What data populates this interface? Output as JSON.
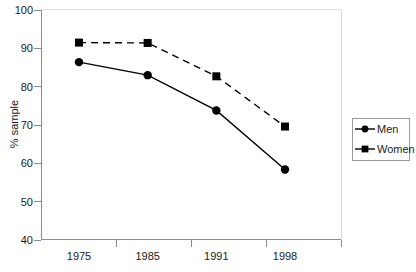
{
  "chart_data": {
    "type": "line",
    "title": "",
    "subtitle": "",
    "xlabel": "",
    "ylabel": "% sample",
    "categories": [
      "1975",
      "1985",
      "1991",
      "1998"
    ],
    "xtick_labels": [
      "1975",
      "1985",
      "1991",
      "1998"
    ],
    "ytick_labels": [
      "40",
      "50",
      "60",
      "70",
      "80",
      "90",
      "100"
    ],
    "ylim": [
      40,
      100
    ],
    "ytick_step": 10,
    "grid": false,
    "legend_position": "right",
    "series": [
      {
        "name": "Men",
        "marker": "circle",
        "linestyle": "solid",
        "color": "#000000",
        "values": [
          86.4,
          83.0,
          73.8,
          58.4
        ]
      },
      {
        "name": "Women",
        "marker": "square",
        "linestyle": "dashed",
        "color": "#000000",
        "values": [
          91.5,
          91.4,
          82.7,
          69.6
        ]
      }
    ]
  },
  "axes": {
    "y_title": "% sample",
    "y_ticks": [
      {
        "label": "100",
        "value": 100
      },
      {
        "label": "90",
        "value": 90
      },
      {
        "label": "80",
        "value": 80
      },
      {
        "label": "70",
        "value": 70
      },
      {
        "label": "60",
        "value": 60
      },
      {
        "label": "50",
        "value": 50
      },
      {
        "label": "40",
        "value": 40
      }
    ],
    "x_ticks": [
      {
        "label": "1975"
      },
      {
        "label": "1985"
      },
      {
        "label": "1991"
      },
      {
        "label": "1998"
      }
    ]
  },
  "legend": {
    "items": [
      {
        "label": "Men",
        "marker": "circle-marker",
        "line": "solid-line"
      },
      {
        "label": "Women",
        "marker": "square-marker",
        "line": "dashed-line"
      }
    ]
  },
  "colors": {
    "axis": "#8c8c8c",
    "text": "#1a1a1a",
    "series": "#000000",
    "background": "#ffffff"
  }
}
